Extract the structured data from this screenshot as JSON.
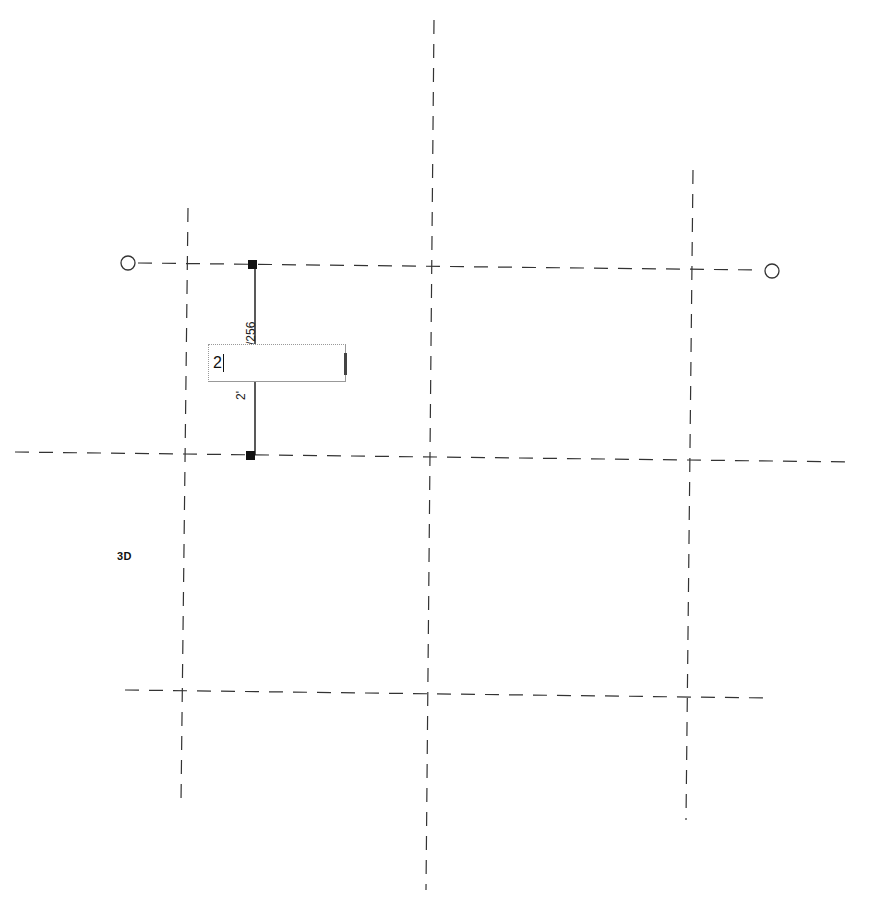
{
  "view": {
    "label": "3D"
  },
  "dimension": {
    "top_text": "/256",
    "bottom_text": "2'",
    "input_value": "2"
  },
  "grid": {
    "line_color": "#333333",
    "horizontal_lines": [
      {
        "x1": 130,
        "y1": 263,
        "x2": 766,
        "y2": 270,
        "bubble_start": true,
        "bubble_end": true
      },
      {
        "x1": 15,
        "y1": 452,
        "x2": 855,
        "y2": 462
      },
      {
        "x1": 125,
        "y1": 690,
        "x2": 768,
        "y2": 698
      }
    ],
    "vertical_lines": [
      {
        "x1": 188,
        "y1": 208,
        "x2": 181,
        "y2": 802
      },
      {
        "x1": 434,
        "y1": 20,
        "x2": 426,
        "y2": 890
      },
      {
        "x1": 693,
        "y1": 170,
        "x2": 686,
        "y2": 820
      }
    ]
  }
}
